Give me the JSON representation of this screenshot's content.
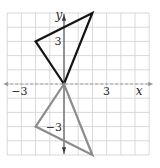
{
  "diagram": {
    "type": "coordinate-plane-reflection",
    "grid": {
      "x_min": -4,
      "x_max": 6,
      "y_min": -5,
      "y_max": 5,
      "origin_px": [
        64,
        84
      ],
      "cell_px": 14.2,
      "color": "#cfcfcf"
    },
    "axes": {
      "x_label": "x",
      "y_label": "y",
      "x_ticks": [
        {
          "value": -3,
          "label": "−3"
        },
        {
          "value": 3,
          "label": "3"
        }
      ],
      "y_ticks": [
        {
          "value": 3,
          "label": "3"
        },
        {
          "value": -3,
          "label": "−3"
        }
      ],
      "color": "#3a3a3a",
      "x_axis_color": "#9a9a9a"
    },
    "shapes": [
      {
        "name": "original-triangle",
        "vertices": [
          [
            0,
            0
          ],
          [
            -2,
            3
          ],
          [
            2,
            5
          ]
        ],
        "stroke": "#141414"
      },
      {
        "name": "reflected-triangle",
        "vertices": [
          [
            0,
            0
          ],
          [
            -2,
            -3
          ],
          [
            2,
            -5
          ]
        ],
        "stroke": "#8c8c8c"
      }
    ]
  }
}
